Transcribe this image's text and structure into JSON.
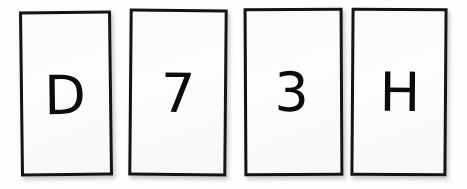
{
  "scene": {
    "width": 467,
    "height": 189,
    "background_color": "#ffffff",
    "description": "Four rectangular cards in a horizontal row, each bearing one large black character"
  },
  "style": {
    "card_fill_color": "#fdfdfd",
    "card_border_color": "#141414",
    "glyph_color": "#0b0b0b",
    "shadow_color": "#6e6e6e"
  },
  "cards": [
    {
      "id": "card-1",
      "character": "D",
      "character_type": "letter",
      "position": 1
    },
    {
      "id": "card-2",
      "character": "7",
      "character_type": "digit",
      "position": 2
    },
    {
      "id": "card-3",
      "character": "3",
      "character_type": "digit",
      "position": 3
    },
    {
      "id": "card-4",
      "character": "H",
      "character_type": "letter",
      "position": 4
    }
  ],
  "sequence": "D 7 3 H"
}
